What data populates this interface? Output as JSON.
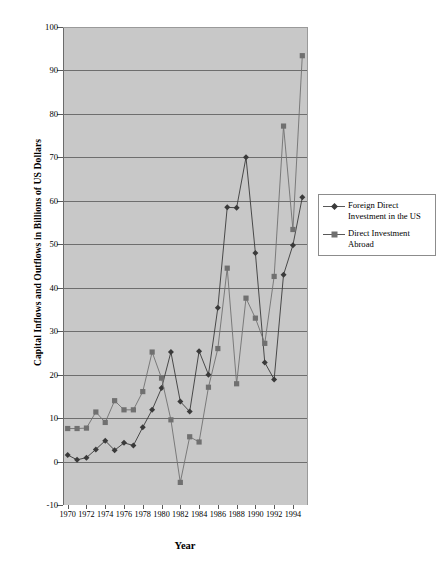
{
  "chart_data": {
    "type": "line",
    "title": "",
    "xlabel": "Year",
    "ylabel": "Capital Inflows and Outflows in Billions of US Dollars",
    "grid": true,
    "legend_position": "right",
    "xlim": [
      1969.5,
      1995.5
    ],
    "ylim": [
      -10,
      100
    ],
    "ytick_step": 10,
    "xtick_step": 2,
    "yticks": [
      "100",
      "90",
      "80",
      "70",
      "60",
      "50",
      "40",
      "30",
      "20",
      "10",
      "0",
      "-10"
    ],
    "xticks": [
      "1970",
      "1972",
      "1974",
      "1976",
      "1978",
      "1980",
      "1982",
      "1984",
      "1986",
      "1988",
      "1990",
      "1992",
      "1994"
    ],
    "x": [
      1970,
      1971,
      1972,
      1973,
      1974,
      1975,
      1976,
      1977,
      1978,
      1979,
      1980,
      1981,
      1982,
      1983,
      1984,
      1985,
      1986,
      1987,
      1988,
      1989,
      1990,
      1991,
      1992,
      1993,
      1994,
      1995
    ],
    "series": [
      {
        "name": "Foreign Direct Investment in the US",
        "marker": "diamond",
        "color": "#3a3a3a",
        "values": [
          1.5,
          0.4,
          0.9,
          2.8,
          4.8,
          2.6,
          4.3,
          3.7,
          7.9,
          11.9,
          16.9,
          25.2,
          13.8,
          11.5,
          25.4,
          20.0,
          35.4,
          58.5,
          58.4,
          70.0,
          48.0,
          22.8,
          18.9,
          43.0,
          49.8,
          60.8
        ]
      },
      {
        "name": "Direct Investment Abroad",
        "marker": "square",
        "color": "#707070",
        "values": [
          7.6,
          7.6,
          7.7,
          11.4,
          9.0,
          14.0,
          11.9,
          11.9,
          16.1,
          25.2,
          19.2,
          9.6,
          -4.8,
          5.7,
          4.5,
          17.1,
          26.0,
          44.5,
          17.9,
          37.6,
          33.0,
          27.2,
          42.6,
          77.2,
          53.4,
          93.4
        ]
      }
    ],
    "colors": {
      "plot_background": "#c8c8c8",
      "gridline": "#6e6e6e",
      "series_1": "#3a3a3a",
      "series_2": "#707070",
      "page_background": "#ffffff"
    }
  },
  "legend": {
    "entries": [
      {
        "label": "Foreign Direct\nInvestment in the US",
        "marker": "diamond-marker"
      },
      {
        "label": "Direct Investment\nAbroad",
        "marker": "square-marker"
      }
    ]
  },
  "axes": {
    "y_title": "Capital Inflows and Outflows in Billions of US Dollars",
    "x_title": "Year"
  }
}
